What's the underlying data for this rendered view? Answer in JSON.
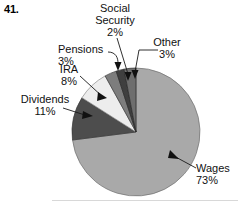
{
  "problem": {
    "number": "41."
  },
  "chart_data": {
    "type": "pie",
    "title": "",
    "subtitle": "",
    "xlabel": "",
    "ylabel": "",
    "legend_position": "callout-labels",
    "grid": false,
    "units": "percent",
    "total": 100,
    "categories": [
      "Wages",
      "Dividends",
      "IRA",
      "Pensions",
      "Social Security",
      "Other"
    ],
    "values": [
      73,
      11,
      8,
      3,
      2,
      3
    ],
    "labels": [
      "73%",
      "11%",
      "8%",
      "3%",
      "2%",
      "3%"
    ],
    "colors": [
      "#a9a9a9",
      "#4d4d4d",
      "#ededed",
      "#7d7d7d",
      "#3f3f3f",
      "#6e6e6e"
    ],
    "start_angle_deg": 0,
    "direction": "clockwise",
    "slices": [
      {
        "name": "Wages",
        "value": 73,
        "label": "Wages",
        "pct_label": "73%",
        "color": "#a9a9a9"
      },
      {
        "name": "Dividends",
        "value": 11,
        "label": "Dividends",
        "pct_label": "11%",
        "color": "#4d4d4d"
      },
      {
        "name": "IRA",
        "value": 8,
        "label": "IRA",
        "pct_label": "8%",
        "color": "#ededed"
      },
      {
        "name": "Pensions",
        "value": 3,
        "label": "Pensions",
        "pct_label": "3%",
        "color": "#7d7d7d"
      },
      {
        "name": "Social Security",
        "value": 2,
        "label": "Social Security",
        "pct_label": "2%",
        "color": "#3f3f3f"
      },
      {
        "name": "Other",
        "value": 3,
        "label": "Other",
        "pct_label": "3%",
        "color": "#6e6e6e"
      }
    ]
  },
  "labels": {
    "social_security_line1": "Social",
    "social_security_line2": "Security",
    "social_security_pct": "2%",
    "other_name": "Other",
    "other_pct": "3%",
    "pensions_name": "Pensions",
    "pensions_pct": "3%",
    "ira_name": "IRA",
    "ira_pct": "8%",
    "dividends_name": "Dividends",
    "dividends_pct": "11%",
    "wages_name": "Wages",
    "wages_pct": "73%"
  }
}
